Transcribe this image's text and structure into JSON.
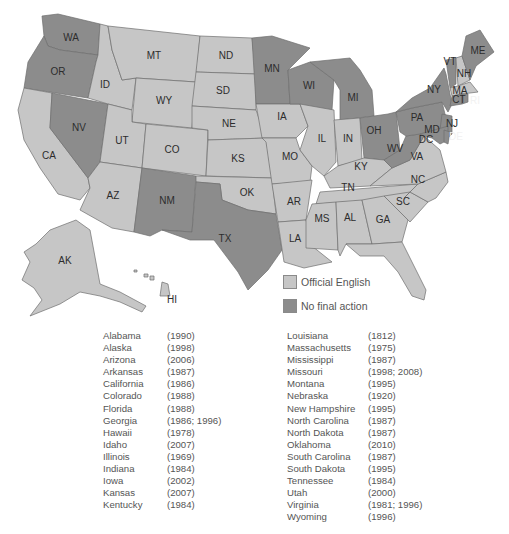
{
  "map": {
    "colors": {
      "official_english": "#c6c6c6",
      "no_final_action": "#8c8c8c",
      "border": "#6e6e6e"
    },
    "states": {
      "WA": "no_final_action",
      "OR": "no_final_action",
      "NV": "no_final_action",
      "NM": "no_final_action",
      "TX": "no_final_action",
      "MN": "no_final_action",
      "WI": "no_final_action",
      "MI": "no_final_action",
      "OH": "no_final_action",
      "WV": "no_final_action",
      "PA": "no_final_action",
      "NY": "no_final_action",
      "VT": "no_final_action",
      "ME": "no_final_action",
      "NJ": "no_final_action",
      "MD": "no_final_action",
      "DE": "no_final_action",
      "CT": "no_final_action",
      "RI": "no_final_action",
      "DC": "no_final_action",
      "CA": "official_english",
      "ID": "official_english",
      "MT": "official_english",
      "WY": "official_english",
      "UT": "official_english",
      "CO": "official_english",
      "AZ": "official_english",
      "ND": "official_english",
      "SD": "official_english",
      "NE": "official_english",
      "KS": "official_english",
      "OK": "official_english",
      "IA": "official_english",
      "MO": "official_english",
      "AR": "official_english",
      "LA": "official_english",
      "IL": "official_english",
      "IN": "official_english",
      "KY": "official_english",
      "TN": "official_english",
      "MS": "official_english",
      "AL": "official_english",
      "GA": "official_english",
      "FL": "official_english",
      "SC": "official_english",
      "NC": "official_english",
      "VA": "official_english",
      "NH": "official_english",
      "MA": "official_english",
      "AK": "official_english",
      "HI": "official_english"
    },
    "labels": {
      "WA": "WA",
      "OR": "OR",
      "CA": "CA",
      "ID": "ID",
      "NV": "NV",
      "MT": "MT",
      "WY": "WY",
      "UT": "UT",
      "CO": "CO",
      "AZ": "AZ",
      "NM": "NM",
      "ND": "ND",
      "SD": "SD",
      "NE": "NE",
      "KS": "KS",
      "OK": "OK",
      "TX": "TX",
      "MN": "MN",
      "IA": "IA",
      "MO": "MO",
      "AR": "AR",
      "LA": "LA",
      "WI": "WI",
      "IL": "IL",
      "MI": "MI",
      "IN": "IN",
      "OH": "OH",
      "KY": "KY",
      "TN": "TN",
      "MS": "MS",
      "AL": "AL",
      "GA": "GA",
      "FL": "FL",
      "SC": "SC",
      "NC": "NC",
      "VA": "VA",
      "WV": "WV",
      "PA": "PA",
      "NY": "NY",
      "VT": "VT",
      "NH": "NH",
      "ME": "ME",
      "MA": "MA",
      "CT": "CT",
      "RI": "RI",
      "NJ": "NJ",
      "DE": "DE",
      "MD": "MD",
      "DC": "DC",
      "AK": "AK",
      "HI": "HI"
    }
  },
  "legend": {
    "items": [
      {
        "label": "Official English",
        "color": "#c6c6c6"
      },
      {
        "label": "No final action",
        "color": "#8c8c8c"
      }
    ]
  },
  "states_list": {
    "left": [
      {
        "name": "Alabama",
        "years": "(1990)"
      },
      {
        "name": "Alaska",
        "years": "(1998)"
      },
      {
        "name": "Arizona",
        "years": "(2006)"
      },
      {
        "name": "Arkansas",
        "years": "(1987)"
      },
      {
        "name": "California",
        "years": "(1986)"
      },
      {
        "name": "Colorado",
        "years": "(1988)"
      },
      {
        "name": "Florida",
        "years": "(1988)"
      },
      {
        "name": "Georgia",
        "years": "(1986; 1996)"
      },
      {
        "name": "Hawaii",
        "years": "(1978)"
      },
      {
        "name": "Idaho",
        "years": "(2007)"
      },
      {
        "name": "Illinois",
        "years": "(1969)"
      },
      {
        "name": "Indiana",
        "years": "(1984)"
      },
      {
        "name": "Iowa",
        "years": "(2002)"
      },
      {
        "name": "Kansas",
        "years": "(2007)"
      },
      {
        "name": "Kentucky",
        "years": "(1984)"
      }
    ],
    "right": [
      {
        "name": "Louisiana",
        "years": "(1812)"
      },
      {
        "name": "Massachusetts",
        "years": "(1975)"
      },
      {
        "name": "Mississippi",
        "years": "(1987)"
      },
      {
        "name": "Missouri",
        "years": "(1998; 2008)"
      },
      {
        "name": "Montana",
        "years": "(1995)"
      },
      {
        "name": "Nebraska",
        "years": "(1920)"
      },
      {
        "name": "New Hampshire",
        "years": "(1995)"
      },
      {
        "name": "North Carolina",
        "years": "(1987)"
      },
      {
        "name": "North Dakota",
        "years": "(1987)"
      },
      {
        "name": "Oklahoma",
        "years": "(2010)"
      },
      {
        "name": "South Carolina",
        "years": "(1987)"
      },
      {
        "name": "South Dakota",
        "years": "(1995)"
      },
      {
        "name": "Tennessee",
        "years": "(1984)"
      },
      {
        "name": "Utah",
        "years": "(2000)"
      },
      {
        "name": "Virginia",
        "years": "(1981; 1996)"
      },
      {
        "name": "Wyoming",
        "years": "(1996)"
      }
    ]
  }
}
